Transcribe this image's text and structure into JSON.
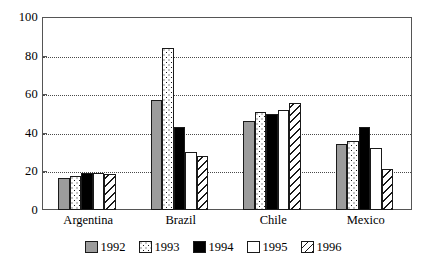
{
  "chart_data": {
    "type": "bar",
    "title": "",
    "subtitle": "",
    "xlabel": "",
    "ylabel": "",
    "categories": [
      "Argentina",
      "Brazil",
      "Chile",
      "Mexico"
    ],
    "series": [
      {
        "name": "1992",
        "values": [
          16.5,
          57,
          46,
          34
        ],
        "color": "#9c9c9c",
        "pattern": "solid-gray"
      },
      {
        "name": "1993",
        "values": [
          17.5,
          84,
          51,
          36
        ],
        "color": "#ffffff",
        "pattern": "dotted"
      },
      {
        "name": "1994",
        "values": [
          19,
          43,
          50,
          43
        ],
        "color": "#000000",
        "pattern": "solid-black"
      },
      {
        "name": "1995",
        "values": [
          19,
          30,
          52,
          32
        ],
        "color": "#ffffff",
        "pattern": "empty"
      },
      {
        "name": "1996",
        "values": [
          18.5,
          28,
          55.5,
          21
        ],
        "color": "#ffffff",
        "pattern": "diagonal-hatch"
      }
    ],
    "ylim": [
      0,
      100
    ],
    "yticks": [
      0,
      20,
      40,
      60,
      80,
      100
    ],
    "ytick_labels": [
      "0",
      "20",
      "40",
      "60",
      "80",
      "100"
    ],
    "grid": true,
    "grid_axis": "y",
    "grid_style": "dotted",
    "legend_position": "bottom-center",
    "legend_entries": [
      "1992",
      "1993",
      "1994",
      "1995",
      "1996"
    ],
    "frame": true,
    "annotations": []
  }
}
